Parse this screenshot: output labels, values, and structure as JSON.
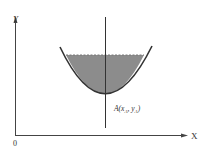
{
  "diagram": {
    "axes": {
      "y_label": "Y",
      "x_label": "X",
      "origin_label": "0"
    },
    "point_label": {
      "prefix": "A",
      "text": "A(x",
      "sub1": "A",
      "sep": ", y",
      "sub2": "A",
      "suffix": ")"
    },
    "colors": {
      "fill": "#8c8c8c",
      "stroke": "#333333"
    }
  }
}
